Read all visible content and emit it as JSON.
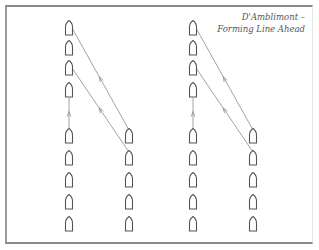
{
  "caption": {
    "line1": "D'Amblimont –",
    "line2": "Forming Line Ahead"
  },
  "colors": {
    "ship_outline": "#555555",
    "track_line": "#8a8a8a",
    "frame": "#8a8a8a",
    "caption_text": "#555555"
  },
  "diagram": {
    "panels": [
      {
        "name": "left-panel",
        "columns": [
          {
            "x": 69,
            "ships_y": [
              28,
              48,
              68,
              90,
              136,
              158,
              180,
              202,
              224
            ]
          },
          {
            "x": 129,
            "ships_y": [
              136,
              158,
              180,
              202,
              224
            ]
          }
        ],
        "tracks": [
          {
            "from": [
              129,
              130
            ],
            "to": [
              72,
              28
            ]
          },
          {
            "from": [
              129,
              152
            ],
            "to": [
              72,
              68
            ]
          },
          {
            "from": [
              69,
              130
            ],
            "to": [
              69,
              98
            ]
          }
        ]
      },
      {
        "name": "right-panel",
        "columns": [
          {
            "x": 193,
            "ships_y": [
              28,
              48,
              68,
              90,
              136,
              158,
              180,
              202,
              224
            ]
          },
          {
            "x": 253,
            "ships_y": [
              136,
              158,
              180,
              202,
              224
            ]
          }
        ],
        "tracks": [
          {
            "from": [
              253,
              130
            ],
            "to": [
              196,
              28
            ]
          },
          {
            "from": [
              253,
              152
            ],
            "to": [
              196,
              68
            ]
          },
          {
            "from": [
              193,
              130
            ],
            "to": [
              193,
              98
            ]
          }
        ]
      }
    ]
  }
}
